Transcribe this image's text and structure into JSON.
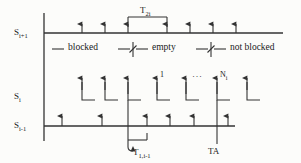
{
  "figure": {
    "background_color": "#fcfcfa",
    "line_color": "#333333"
  },
  "rows": [
    {
      "id": "s-i-plus-1",
      "label_base": "S",
      "label_sub": "i+1",
      "y": 33
    },
    {
      "id": "s-i",
      "label_base": "S",
      "label_sub": "i",
      "y": 97
    },
    {
      "id": "s-i-minus-1",
      "label_base": "S",
      "label_sub": "i-1",
      "y": 126
    }
  ],
  "legend": {
    "items": [
      {
        "id": "blocked",
        "text": "blocked"
      },
      {
        "id": "empty",
        "text": "empty"
      },
      {
        "id": "not-blocked",
        "text": "not blocked"
      }
    ]
  },
  "brackets": [
    {
      "id": "t2i",
      "label_base": "T",
      "label_sub": "2i",
      "x_start": 128,
      "x_end": 167,
      "y": 18
    },
    {
      "id": "t1-i-minus-1",
      "label_base": "T",
      "label_sub": "1,i-1",
      "label_text": "T",
      "x_start": 128,
      "x_end": 147,
      "y": 140
    }
  ],
  "markers": {
    "ta": {
      "id": "ta",
      "text": "TA",
      "x": 217,
      "y": 151
    }
  },
  "middle_row_marks": [
    {
      "id": "mark-1",
      "text": "1"
    },
    {
      "id": "mark-dots",
      "text": "···"
    },
    {
      "id": "mark-n",
      "text": "N",
      "sub": "i"
    }
  ],
  "arrows": {
    "top_row_x": [
      82,
      105,
      128,
      167,
      190,
      213,
      236
    ],
    "middle_row_x": [
      82,
      105,
      128,
      157,
      186,
      217,
      247
    ],
    "bottom_row_x": [
      62,
      102,
      128,
      147,
      170,
      194,
      217,
      240
    ]
  }
}
